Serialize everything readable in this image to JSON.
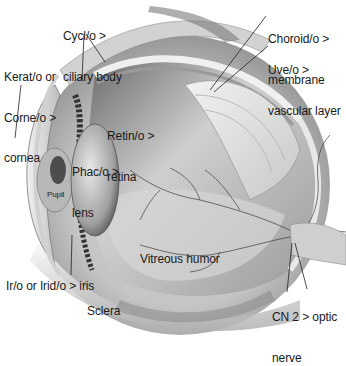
{
  "diagram": {
    "labels": [
      {
        "id": "ciliary-body",
        "lines": [
          "Cycl/o >",
          "ciliary body"
        ]
      },
      {
        "id": "cornea",
        "lines": [
          "Kerat/o or",
          "Corne/o >",
          "cornea"
        ]
      },
      {
        "id": "choroid",
        "lines": [
          "Choroid/o >",
          "membrane"
        ]
      },
      {
        "id": "uvea",
        "lines": [
          "Uve/o >",
          "vascular layer"
        ]
      },
      {
        "id": "retina",
        "lines": [
          "Retin/o >",
          "retina"
        ]
      },
      {
        "id": "lens",
        "lines": [
          "Phac/o >",
          "lens"
        ]
      },
      {
        "id": "pupil",
        "lines": [
          "Pupil"
        ]
      },
      {
        "id": "iris",
        "lines": [
          "Ir/o or Irid/o > iris"
        ]
      },
      {
        "id": "vitreous-humor",
        "lines": [
          "Vitreous humor"
        ]
      },
      {
        "id": "sclera",
        "lines": [
          "Sclera"
        ]
      },
      {
        "id": "optic-nerve",
        "lines": [
          "CN 2 > optic",
          "nerve"
        ]
      }
    ],
    "colors": {
      "background": "#ffffff",
      "label_text": "#1a1a1a",
      "leader_line": "#222222",
      "tissue_light": "#e6e6e6",
      "tissue_mid": "#b5b5b5",
      "tissue_dark": "#4a4a4a",
      "vessel": "#3a3a3a"
    }
  }
}
